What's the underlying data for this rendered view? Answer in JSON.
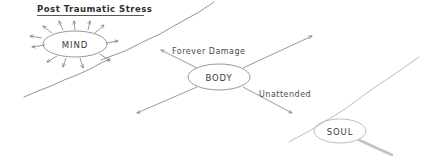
{
  "diagram": {
    "title": "Post Traumatic Stress",
    "nodes": [
      {
        "id": "mind",
        "label": "MIND",
        "cx": 75,
        "cy": 44,
        "rx": 32,
        "ry": 13
      },
      {
        "id": "body",
        "label": "BODY",
        "cx": 219,
        "cy": 77,
        "rx": 31,
        "ry": 13
      },
      {
        "id": "soul",
        "label": "SOUL",
        "cx": 340,
        "cy": 131,
        "rx": 26,
        "ry": 12
      }
    ],
    "edge_labels": [
      {
        "id": "forever-damage",
        "text": "Forever Damage",
        "x": 172,
        "y": 54
      },
      {
        "id": "unattended",
        "text": "Unattended",
        "x": 259,
        "y": 97
      }
    ],
    "colors": {
      "background": "#ffffff",
      "ink": "#4a4a4a",
      "node_stroke": "#8c8c8c",
      "title_ink": "#2e2e2e",
      "faint_stroke": "#b4b4b4"
    }
  }
}
